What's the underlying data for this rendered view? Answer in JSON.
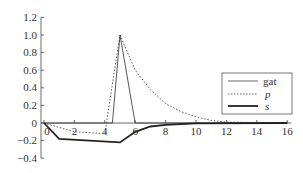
{
  "chart_data": {
    "type": "line",
    "title": "",
    "xlabel": "",
    "ylabel": "",
    "xlim": [
      0,
      16
    ],
    "ylim": [
      -0.4,
      1.2
    ],
    "x_ticks": [
      "0",
      "2",
      "4",
      "6",
      "8",
      "10",
      "12",
      "14",
      "16"
    ],
    "y_ticks": [
      "1.2",
      "1.0",
      "0.8",
      "0.6",
      "0.4",
      "0.2",
      "0",
      "−0.2",
      "−0.4"
    ],
    "grid": false,
    "legend_position": "right-middle",
    "series": [
      {
        "name": "gat",
        "style": "thin-solid",
        "points": [
          [
            0,
            0
          ],
          [
            4.5,
            0
          ],
          [
            5,
            1.0
          ],
          [
            6,
            0
          ],
          [
            16,
            0
          ]
        ]
      },
      {
        "name": "p",
        "style": "dotted",
        "points": [
          [
            0,
            0
          ],
          [
            2,
            -0.1
          ],
          [
            4,
            -0.12
          ],
          [
            5,
            1.0
          ],
          [
            6,
            0.6
          ],
          [
            7,
            0.38
          ],
          [
            8,
            0.22
          ],
          [
            9,
            0.13
          ],
          [
            10,
            0.07
          ],
          [
            11,
            0.03
          ],
          [
            12,
            0.01
          ],
          [
            16,
            0
          ]
        ]
      },
      {
        "name": "s",
        "style": "thick-solid",
        "points": [
          [
            0,
            0
          ],
          [
            1,
            -0.18
          ],
          [
            5,
            -0.22
          ],
          [
            6,
            -0.1
          ],
          [
            7,
            -0.04
          ],
          [
            8,
            -0.02
          ],
          [
            10,
            -0.005
          ],
          [
            16,
            0
          ]
        ]
      }
    ]
  },
  "legend": {
    "items": [
      {
        "label": "gat"
      },
      {
        "label": "p"
      },
      {
        "label": "s"
      }
    ]
  }
}
